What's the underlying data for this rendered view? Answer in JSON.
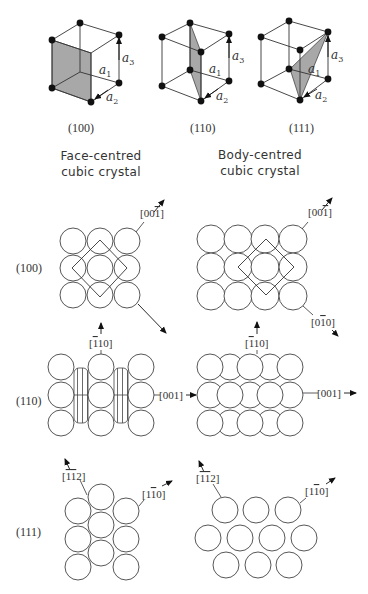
{
  "figure": {
    "cubes": [
      {
        "plane_label": "(100)",
        "axes": {
          "a1": "a",
          "a1_sub": "1",
          "a2": "a",
          "a2_sub": "2",
          "a3": "a",
          "a3_sub": "3"
        }
      },
      {
        "plane_label": "(110)",
        "axes": {
          "a1": "a",
          "a1_sub": "1",
          "a2": "a",
          "a2_sub": "2",
          "a3": "a",
          "a3_sub": "3"
        }
      },
      {
        "plane_label": "(111)",
        "axes": {
          "a1": "a",
          "a1_sub": "1",
          "a2": "a",
          "a2_sub": "2",
          "a3": "a",
          "a3_sub": "3"
        }
      }
    ],
    "columns": {
      "fcc": {
        "line1": "Face-centred",
        "line2": "cubic crystal"
      },
      "bcc": {
        "line1": "Body-centred",
        "line2": "cubic crystal"
      }
    },
    "rows": [
      {
        "plane": "(100)"
      },
      {
        "plane": "(110)"
      },
      {
        "plane": "(111)"
      }
    ],
    "directions": {
      "fcc_100_up": {
        "pre": "[00",
        "bar": "1",
        "post": "]"
      },
      "bcc_100_up": {
        "pre": "[00",
        "bar": "1",
        "post": "]"
      },
      "bcc_100_down": {
        "pre": "[0",
        "bar": "1",
        "post": "0]"
      },
      "fcc_110_up": {
        "pre": "[",
        "bar": "1",
        "post": "10]"
      },
      "fcc_110_right": {
        "pre": "[001]",
        "bar": "",
        "post": ""
      },
      "bcc_110_up": {
        "pre": "[",
        "bar": "1",
        "post": "10]"
      },
      "bcc_110_right": {
        "pre": "[001]",
        "bar": "",
        "post": ""
      },
      "fcc_111_left": {
        "pre": "[",
        "bar": "11",
        "post": "2]"
      },
      "fcc_111_right": {
        "pre": "[1",
        "bar": "1",
        "post": "0]"
      },
      "bcc_111_left": {
        "pre": "[",
        "bar": "11",
        "post": "2]"
      },
      "bcc_111_right": {
        "pre": "[1",
        "bar": "1",
        "post": "0]"
      }
    },
    "colors": {
      "shade": "#a8a8a8",
      "line": "#333333",
      "node": "#111111"
    }
  }
}
